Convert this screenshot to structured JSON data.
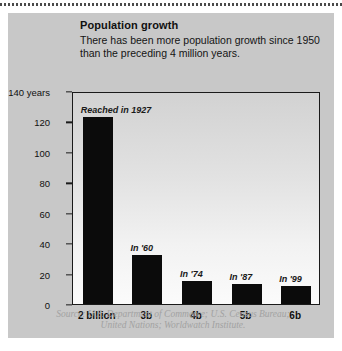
{
  "title": "Population growth",
  "subtitle": "There has been more population growth since 1950 than the preceding 4 million years.",
  "source": "Source: U.S. Department of Commerce; U.S. Census Bureau; United Nations; Worldwatch Institute.",
  "chart_data": {
    "type": "bar",
    "title": "Population growth",
    "xlabel": "",
    "ylabel": "140 years",
    "ylim": [
      0,
      140
    ],
    "yticks": [
      0,
      20,
      40,
      60,
      80,
      100,
      120,
      140
    ],
    "ytick_labels": [
      "0",
      "20",
      "40",
      "60",
      "80",
      "100",
      "120",
      "140 years"
    ],
    "grid": false,
    "legend": "none",
    "categories": [
      "2 billion",
      "3b",
      "4b",
      "5b",
      "6b"
    ],
    "values": [
      123,
      32,
      15,
      13,
      12
    ],
    "annotations": [
      "Reached in 1927",
      "In '60",
      "In '74",
      "In '87",
      "In '99"
    ]
  }
}
